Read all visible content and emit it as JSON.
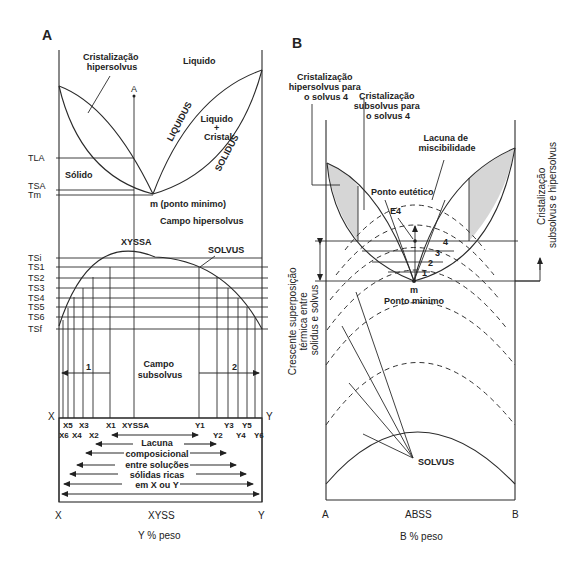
{
  "panel_a": {
    "label": "A",
    "regions": {
      "hyper_cryst": [
        "Cristalização",
        "hipersolvus"
      ],
      "liquid": "Liquido",
      "liquid_crystal": [
        "Liquido",
        "+",
        "Cristal"
      ],
      "solid": "Sólido",
      "min_point": "m (ponto minimo)",
      "hyper_field": "Campo hipersolvus",
      "sub_field": [
        "Campo",
        "subsolvus"
      ]
    },
    "curves": {
      "liquidus": "LIQUIDUS",
      "solidus": "SOLIDUS",
      "solvus": "SOLVUS"
    },
    "point_a": "A",
    "xyssa_top": "XYSSA",
    "temps": [
      "TLA",
      "TSA",
      "Tm",
      "TSi",
      "TS1",
      "TS2",
      "TS3",
      "TS4",
      "TS5",
      "TS6",
      "TSf"
    ],
    "arrows": [
      "1",
      "2"
    ],
    "axis_ends": [
      "X",
      "Y"
    ],
    "comp_row1": [
      "X5",
      "X3",
      "X1",
      "XYSSA",
      "Y1",
      "Y3",
      "Y5"
    ],
    "comp_row2": [
      "X6",
      "X4",
      "X2",
      "Y2",
      "Y4",
      "Y6"
    ],
    "gap_text": [
      "Lacuna",
      "composicional",
      "entre soluções",
      "sólidas ricas",
      "em X ou Y"
    ],
    "bottom_axis": [
      "X",
      "XYSS",
      "Y"
    ],
    "xlabel": "Y % peso"
  },
  "panel_b": {
    "label": "B",
    "labels": {
      "hyper4": [
        "Cristalização",
        "hipersolvus para",
        "o solvus 4"
      ],
      "sub4": [
        "Cristalização",
        "subsolvus para",
        "o solvus 4"
      ],
      "miscibility_gap": [
        "Lacuna de",
        "miscibilidade"
      ],
      "eutectic": "Ponto eutético",
      "e4": "E4",
      "m": "m",
      "min_point": "Ponto minimo",
      "solvus": "SOLVUS"
    },
    "solvus_numbers": [
      "4",
      "3",
      "2",
      "1"
    ],
    "left_rotated": [
      "Crescente superposição",
      "térmica entre",
      "solidus e solvus"
    ],
    "right_rotated": [
      "Cristalização",
      "subsolvus e hipersolvus"
    ],
    "bottom_axis": [
      "A",
      "ABSS",
      "B"
    ],
    "xlabel": "B % peso"
  }
}
